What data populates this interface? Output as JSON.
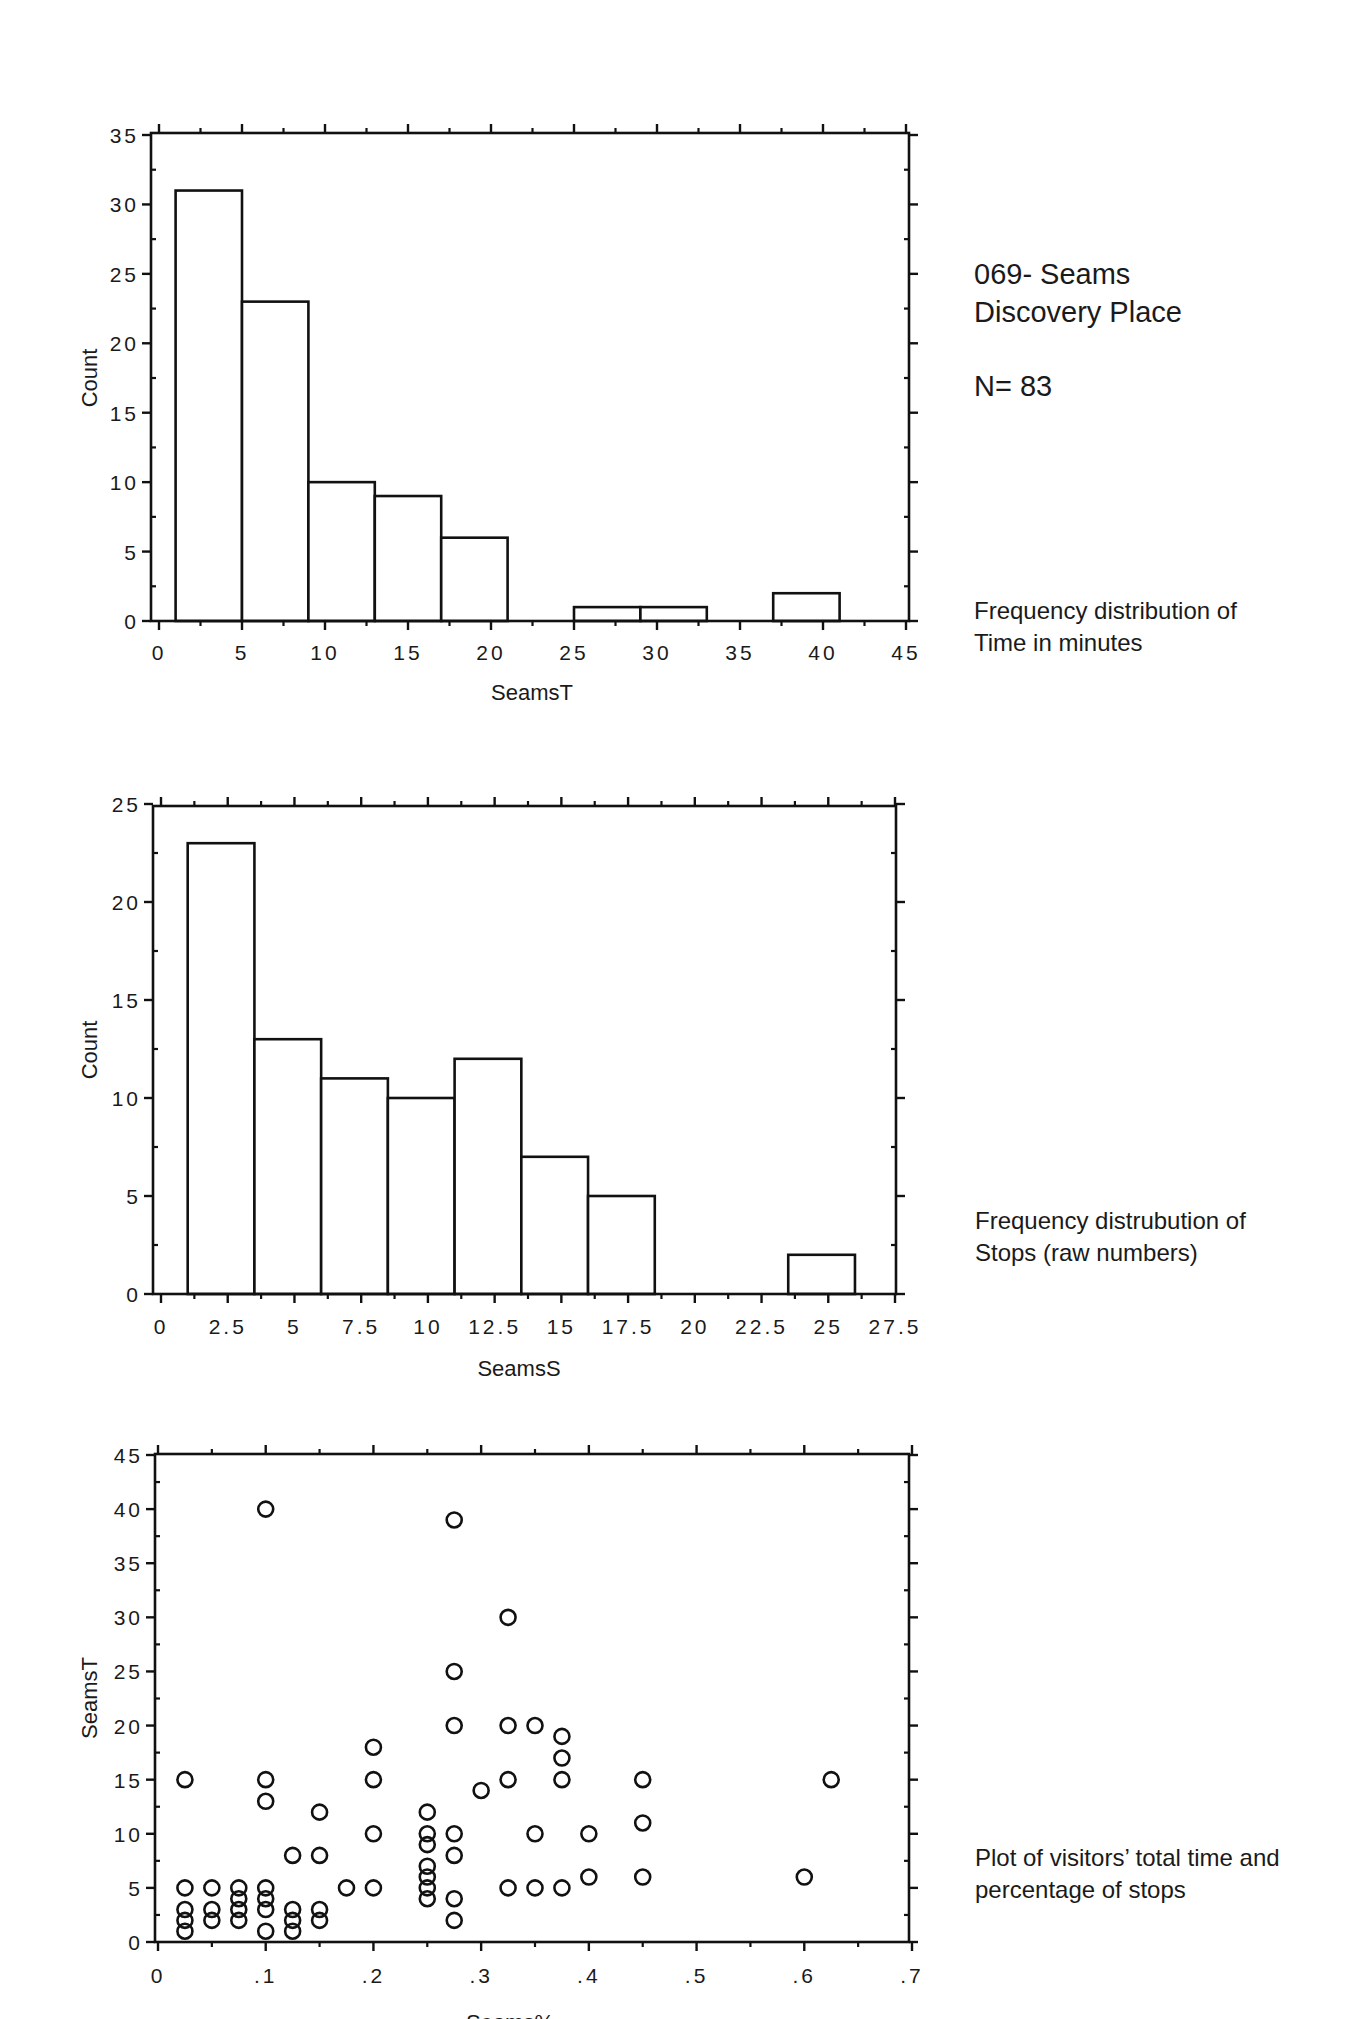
{
  "side": {
    "title_line1": "069- Seams",
    "title_line2": "Discovery Place",
    "n_label": "N= 83",
    "caption1_line1": "Frequency distribution of",
    "caption1_line2": "Time in minutes",
    "caption2_line1": "Frequency distrubution of",
    "caption2_line2": "Stops (raw numbers)",
    "caption3_line1": "Plot of visitors’ total time and",
    "caption3_line2": "percentage of stops"
  },
  "chart_data": [
    {
      "type": "bar",
      "subtype": "histogram",
      "title": "Frequency distribution of Time in minutes",
      "xlabel": "SeamsT",
      "ylabel": "Count",
      "xlim": [
        0,
        45
      ],
      "ylim": [
        0,
        35
      ],
      "x_ticks": [
        "0",
        "5",
        "10",
        "15",
        "20",
        "25",
        "30",
        "35",
        "40",
        "45"
      ],
      "y_ticks": [
        "0",
        "5",
        "10",
        "15",
        "20",
        "25",
        "30",
        "35"
      ],
      "grid": false,
      "bins": [
        {
          "from": 1,
          "to": 5,
          "count": 31
        },
        {
          "from": 5,
          "to": 9,
          "count": 23
        },
        {
          "from": 9,
          "to": 13,
          "count": 10
        },
        {
          "from": 13,
          "to": 17,
          "count": 9
        },
        {
          "from": 17,
          "to": 21,
          "count": 6
        },
        {
          "from": 21,
          "to": 25,
          "count": 0
        },
        {
          "from": 25,
          "to": 29,
          "count": 1
        },
        {
          "from": 29,
          "to": 33,
          "count": 1
        },
        {
          "from": 33,
          "to": 37,
          "count": 0
        },
        {
          "from": 37,
          "to": 41,
          "count": 2
        }
      ]
    },
    {
      "type": "bar",
      "subtype": "histogram",
      "title": "Frequency distrubution of Stops (raw numbers)",
      "xlabel": "SeamsS",
      "ylabel": "Count",
      "xlim": [
        0,
        27.5
      ],
      "ylim": [
        0,
        25
      ],
      "x_ticks": [
        "0",
        "2.5",
        "5",
        "7.5",
        "10",
        "12.5",
        "15",
        "17.5",
        "20",
        "22.5",
        "25",
        "27.5"
      ],
      "y_ticks": [
        "0",
        "5",
        "10",
        "15",
        "20",
        "25"
      ],
      "grid": false,
      "bins": [
        {
          "from": 1,
          "to": 3.5,
          "count": 23
        },
        {
          "from": 3.5,
          "to": 6,
          "count": 13
        },
        {
          "from": 6,
          "to": 8.5,
          "count": 11
        },
        {
          "from": 8.5,
          "to": 11,
          "count": 10
        },
        {
          "from": 11,
          "to": 13.5,
          "count": 12
        },
        {
          "from": 13.5,
          "to": 16,
          "count": 7
        },
        {
          "from": 16,
          "to": 18.5,
          "count": 5
        },
        {
          "from": 18.5,
          "to": 21,
          "count": 0
        },
        {
          "from": 21,
          "to": 23.5,
          "count": 0
        },
        {
          "from": 23.5,
          "to": 26,
          "count": 2
        }
      ]
    },
    {
      "type": "scatter",
      "title": "Plot of visitors’ total time and percentage of stops",
      "xlabel": "Seams%",
      "ylabel": "SeamsT",
      "xlim": [
        0,
        0.7
      ],
      "ylim": [
        0,
        45
      ],
      "x_ticks": [
        "0",
        ".1",
        ".2",
        ".3",
        ".4",
        ".5",
        ".6",
        ".7"
      ],
      "y_ticks": [
        "0",
        "5",
        "10",
        "15",
        "20",
        "25",
        "30",
        "35",
        "40",
        "45"
      ],
      "grid": false,
      "marker": "open-circle",
      "points": [
        [
          0.025,
          15
        ],
        [
          0.025,
          5
        ],
        [
          0.025,
          3
        ],
        [
          0.025,
          2
        ],
        [
          0.025,
          1
        ],
        [
          0.05,
          5
        ],
        [
          0.05,
          3
        ],
        [
          0.05,
          2
        ],
        [
          0.075,
          5
        ],
        [
          0.075,
          4
        ],
        [
          0.075,
          3
        ],
        [
          0.075,
          2
        ],
        [
          0.1,
          40
        ],
        [
          0.1,
          15
        ],
        [
          0.1,
          13
        ],
        [
          0.1,
          5
        ],
        [
          0.1,
          4
        ],
        [
          0.1,
          3
        ],
        [
          0.1,
          1
        ],
        [
          0.125,
          8
        ],
        [
          0.125,
          3
        ],
        [
          0.125,
          2
        ],
        [
          0.125,
          1
        ],
        [
          0.15,
          12
        ],
        [
          0.15,
          8
        ],
        [
          0.15,
          3
        ],
        [
          0.15,
          2
        ],
        [
          0.175,
          5
        ],
        [
          0.2,
          18
        ],
        [
          0.2,
          15
        ],
        [
          0.2,
          10
        ],
        [
          0.2,
          5
        ],
        [
          0.25,
          12
        ],
        [
          0.25,
          10
        ],
        [
          0.25,
          9
        ],
        [
          0.25,
          7
        ],
        [
          0.25,
          6
        ],
        [
          0.25,
          5
        ],
        [
          0.25,
          4
        ],
        [
          0.275,
          39
        ],
        [
          0.275,
          25
        ],
        [
          0.275,
          20
        ],
        [
          0.275,
          10
        ],
        [
          0.275,
          8
        ],
        [
          0.275,
          4
        ],
        [
          0.275,
          2
        ],
        [
          0.3,
          14
        ],
        [
          0.325,
          30
        ],
        [
          0.325,
          20
        ],
        [
          0.325,
          15
        ],
        [
          0.325,
          5
        ],
        [
          0.35,
          20
        ],
        [
          0.35,
          10
        ],
        [
          0.35,
          5
        ],
        [
          0.375,
          19
        ],
        [
          0.375,
          17
        ],
        [
          0.375,
          15
        ],
        [
          0.375,
          5
        ],
        [
          0.4,
          10
        ],
        [
          0.4,
          6
        ],
        [
          0.45,
          15
        ],
        [
          0.45,
          11
        ],
        [
          0.45,
          6
        ],
        [
          0.6,
          6
        ],
        [
          0.625,
          15
        ]
      ]
    }
  ]
}
